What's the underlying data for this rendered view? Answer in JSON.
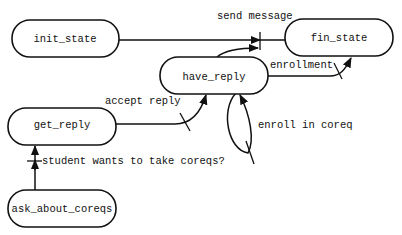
{
  "diagram": {
    "type": "state-transition",
    "nodes": [
      {
        "id": "init_state",
        "label": "init_state"
      },
      {
        "id": "fin_state",
        "label": "fin_state"
      },
      {
        "id": "have_reply",
        "label": "have_reply"
      },
      {
        "id": "get_reply",
        "label": "get_reply"
      },
      {
        "id": "ask_about_coreqs",
        "label": "ask_about_coreqs"
      }
    ],
    "edges": [
      {
        "from": "init_state",
        "to": "fin_state",
        "label": "send message"
      },
      {
        "from": "have_reply",
        "to": "fin_state",
        "label": ""
      },
      {
        "from": "have_reply",
        "to": "fin_state",
        "label": "enrollment"
      },
      {
        "from": "get_reply",
        "to": "have_reply",
        "label": "accept reply"
      },
      {
        "from": "have_reply",
        "to": "have_reply",
        "label": "enroll in coreq"
      },
      {
        "from": "ask_about_coreqs",
        "to": "get_reply",
        "label": "student wants to take coreqs?"
      }
    ]
  }
}
